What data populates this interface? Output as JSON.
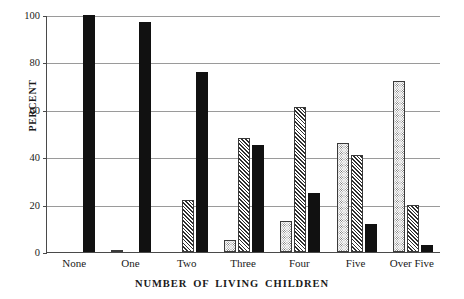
{
  "chart_data": {
    "type": "bar",
    "title": "",
    "subtitle": "",
    "xlabel": "NUMBER OF LIVING CHILDREN",
    "ylabel": "PERCENT",
    "categories": [
      "None",
      "One",
      "Two",
      "Three",
      "Four",
      "Five",
      "Over Five"
    ],
    "series": [
      {
        "name": "dotted",
        "pattern": "dotted",
        "values": [
          0,
          1,
          0,
          5,
          13,
          46,
          72
        ]
      },
      {
        "name": "hatched",
        "pattern": "diagonal-hatch",
        "values": [
          0,
          0,
          22,
          48,
          61,
          41,
          20
        ]
      },
      {
        "name": "solid",
        "pattern": "solid-black",
        "values": [
          100,
          97,
          76,
          45,
          25,
          12,
          3
        ]
      }
    ],
    "ylim": [
      0,
      100
    ],
    "yticks": [
      0,
      20,
      40,
      60,
      80,
      100
    ],
    "ytick_labels": [
      "0",
      "20",
      "40",
      "60",
      "80",
      "100"
    ],
    "grid": true,
    "grid_axis": "y",
    "legend": false,
    "legend_position": "none",
    "annotations": []
  },
  "colors": {
    "solid_bar": "#111111",
    "hatch_line": "#2e2e2e",
    "dot": "#5d5d5d",
    "bar_outline": "#3a3a3a",
    "gridline": "#9a9a9a",
    "axis": "#4a4a4a",
    "background": "#ffffff",
    "text": "#1a1a1a"
  }
}
